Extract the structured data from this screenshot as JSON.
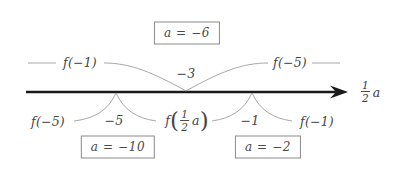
{
  "figure": {
    "type": "number-line-diagram",
    "axis": {
      "variable_label_numerator": "1",
      "variable_label_denominator": "2",
      "variable_label_symbol": "a",
      "arrow_direction": "right"
    },
    "above_axis": {
      "left_label": "f(−1)",
      "center_label": "−3",
      "right_label": "f(−5)",
      "boxed_note": "a = −6"
    },
    "below_axis": {
      "far_left_label": "f(−5)",
      "left_label": "−5",
      "center_function_prefix": "f",
      "center_function_numerator": "1",
      "center_function_denominator": "2",
      "center_function_variable": "a",
      "right_label": "−1",
      "far_right_label": "f(−1)",
      "boxed_note_left": "a = −10",
      "boxed_note_right": "a = −2"
    },
    "colors": {
      "axis": "#1a1a1a",
      "curve": "#9a9a9a",
      "text": "#454545",
      "box_border": "#8a8a8a",
      "background": "#ffffff"
    }
  }
}
